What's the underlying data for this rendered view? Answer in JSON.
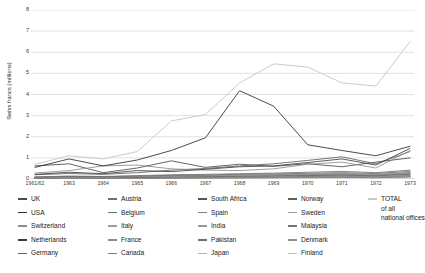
{
  "chart_data": {
    "type": "line",
    "title": "",
    "xlabel": "",
    "ylabel": "Swiss francs (millions)",
    "ylim": [
      0,
      8
    ],
    "yticks": [
      "0",
      "1",
      "2",
      "3",
      "4",
      "5",
      "6",
      "7",
      "8"
    ],
    "grid": true,
    "legend_position": "bottom",
    "categories": [
      "1961/62",
      "1963",
      "1964",
      "1965",
      "1966",
      "1967",
      "1968",
      "1969",
      "1970",
      "1971",
      "1972",
      "1973"
    ],
    "series": [
      {
        "name": "UK",
        "color": "#4a4a4a",
        "values": [
          0.62,
          0.72,
          0.3,
          0.52,
          0.86,
          0.55,
          0.7,
          0.6,
          0.72,
          0.58,
          0.8,
          1.0
        ]
      },
      {
        "name": "USA",
        "color": "#2b2b2b",
        "values": [
          0.55,
          0.95,
          0.62,
          0.9,
          1.35,
          1.95,
          4.18,
          3.45,
          1.62,
          1.35,
          1.1,
          1.55
        ]
      },
      {
        "name": "Switzerland",
        "color": "#8d8d8d",
        "values": [
          0.28,
          0.4,
          0.62,
          0.66,
          0.48,
          0.42,
          0.4,
          0.48,
          0.7,
          0.8,
          0.52,
          1.35
        ]
      },
      {
        "name": "Netherlands",
        "color": "#3d3d3d",
        "values": [
          0.22,
          0.32,
          0.25,
          0.4,
          0.35,
          0.46,
          0.58,
          0.62,
          0.78,
          0.95,
          0.66,
          1.45
        ]
      },
      {
        "name": "Germany",
        "color": "#5e5e5e",
        "values": [
          0.2,
          0.26,
          0.22,
          0.3,
          0.42,
          0.5,
          0.62,
          0.72,
          0.88,
          1.05,
          0.72,
          1.3
        ]
      },
      {
        "name": "Austria",
        "color": "#707070",
        "values": [
          0.1,
          0.14,
          0.12,
          0.16,
          0.2,
          0.22,
          0.25,
          0.28,
          0.32,
          0.36,
          0.3,
          0.42
        ]
      },
      {
        "name": "Belgium",
        "color": "#6a6a6a",
        "values": [
          0.09,
          0.12,
          0.11,
          0.14,
          0.17,
          0.19,
          0.22,
          0.24,
          0.27,
          0.3,
          0.26,
          0.36
        ]
      },
      {
        "name": "Italy",
        "color": "#9a9a9a",
        "values": [
          0.08,
          0.1,
          0.09,
          0.12,
          0.14,
          0.16,
          0.18,
          0.2,
          0.23,
          0.26,
          0.22,
          0.31
        ]
      },
      {
        "name": "France",
        "color": "#8a8a8a",
        "values": [
          0.07,
          0.09,
          0.08,
          0.11,
          0.13,
          0.15,
          0.17,
          0.19,
          0.21,
          0.24,
          0.2,
          0.29
        ]
      },
      {
        "name": "Canada",
        "color": "#7d7d7d",
        "values": [
          0.06,
          0.08,
          0.07,
          0.1,
          0.12,
          0.14,
          0.16,
          0.18,
          0.2,
          0.22,
          0.19,
          0.27
        ]
      },
      {
        "name": "South Africa",
        "color": "#555555",
        "values": [
          0.05,
          0.07,
          0.06,
          0.09,
          0.11,
          0.13,
          0.15,
          0.16,
          0.18,
          0.2,
          0.17,
          0.25
        ]
      },
      {
        "name": "Spain",
        "color": "#828282",
        "values": [
          0.05,
          0.06,
          0.06,
          0.08,
          0.1,
          0.11,
          0.13,
          0.14,
          0.16,
          0.18,
          0.15,
          0.22
        ]
      },
      {
        "name": "India",
        "color": "#979797",
        "values": [
          0.04,
          0.05,
          0.05,
          0.07,
          0.08,
          0.1,
          0.11,
          0.12,
          0.14,
          0.15,
          0.13,
          0.19
        ]
      },
      {
        "name": "Pakistan",
        "color": "#6f6f6f",
        "values": [
          0.04,
          0.05,
          0.04,
          0.06,
          0.07,
          0.09,
          0.1,
          0.11,
          0.12,
          0.14,
          0.12,
          0.17
        ]
      },
      {
        "name": "Japan",
        "color": "#b4b4b4",
        "values": [
          0.03,
          0.04,
          0.04,
          0.05,
          0.07,
          0.08,
          0.09,
          0.1,
          0.11,
          0.12,
          0.1,
          0.15
        ]
      },
      {
        "name": "Norway",
        "color": "#606060",
        "values": [
          0.03,
          0.04,
          0.03,
          0.05,
          0.06,
          0.07,
          0.08,
          0.09,
          0.1,
          0.11,
          0.09,
          0.14
        ]
      },
      {
        "name": "Sweden",
        "color": "#9e9e9e",
        "values": [
          0.03,
          0.03,
          0.03,
          0.04,
          0.05,
          0.06,
          0.07,
          0.08,
          0.09,
          0.1,
          0.08,
          0.12
        ]
      },
      {
        "name": "Malaysia",
        "color": "#747474",
        "values": [
          0.02,
          0.03,
          0.03,
          0.04,
          0.05,
          0.05,
          0.06,
          0.07,
          0.08,
          0.09,
          0.07,
          0.11
        ]
      },
      {
        "name": "Denmark",
        "color": "#8f8f8f",
        "values": [
          0.02,
          0.02,
          0.02,
          0.03,
          0.04,
          0.05,
          0.05,
          0.06,
          0.07,
          0.08,
          0.06,
          0.1
        ]
      },
      {
        "name": "Finland",
        "color": "#c0c0c0",
        "values": [
          0.02,
          0.02,
          0.02,
          0.03,
          0.03,
          0.04,
          0.05,
          0.05,
          0.06,
          0.07,
          0.05,
          0.09
        ]
      },
      {
        "name": "TOTAL",
        "color": "#c9c9c9",
        "values": [
          0.7,
          1.1,
          0.95,
          1.3,
          2.75,
          3.05,
          4.55,
          5.45,
          5.3,
          4.55,
          4.4,
          6.5
        ]
      }
    ]
  },
  "legend": {
    "columns": [
      {
        "entries": [
          {
            "label": "UK",
            "series": "UK"
          },
          {
            "label": "USA",
            "series": "USA"
          },
          {
            "label": "Switzerland",
            "series": "Switzerland"
          },
          {
            "label": "Netherlands",
            "series": "Netherlands"
          },
          {
            "label": "Germany",
            "series": "Germany"
          }
        ]
      },
      {
        "entries": [
          {
            "label": "Austria",
            "series": "Austria"
          },
          {
            "label": "Belgium",
            "series": "Belgium"
          },
          {
            "label": "Italy",
            "series": "Italy"
          },
          {
            "label": "France",
            "series": "France"
          },
          {
            "label": "Canada",
            "series": "Canada"
          }
        ]
      },
      {
        "entries": [
          {
            "label": "South Africa",
            "series": "South Africa"
          },
          {
            "label": "Spain",
            "series": "Spain"
          },
          {
            "label": "India",
            "series": "India"
          },
          {
            "label": "Pakistan",
            "series": "Pakistan"
          },
          {
            "label": "Japan",
            "series": "Japan"
          }
        ]
      },
      {
        "entries": [
          {
            "label": "Norway",
            "series": "Norway"
          },
          {
            "label": "Sweden",
            "series": "Sweden"
          },
          {
            "label": "Malaysia",
            "series": "Malaysia"
          },
          {
            "label": "Denmark",
            "series": "Denmark"
          },
          {
            "label": "Finland",
            "series": "Finland"
          }
        ]
      },
      {
        "entries": [
          {
            "label": "TOTAL",
            "sub1": "of all",
            "sub2": "national offices",
            "series": "TOTAL"
          }
        ]
      }
    ]
  },
  "style": {
    "grid_color": "#c8c8c8",
    "axis_color": "#9a9a9a",
    "background": "#ffffff"
  }
}
